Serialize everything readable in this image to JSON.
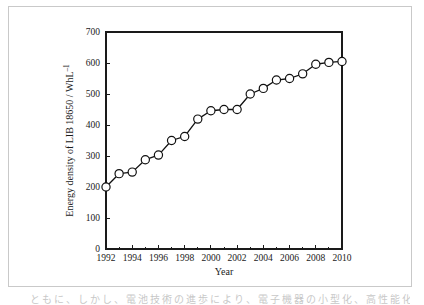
{
  "figure": {
    "border_color": "#c9c9c9",
    "background": "#ffffff",
    "bleed_text": "ともに、しかし、電池技術の進歩により、電子機器の小型化、高性能化"
  },
  "chart_data": {
    "type": "line",
    "title": "",
    "subtitle": "",
    "xlabel": "Year",
    "ylabel": "Energy density of LIB 18650 / WhL⁻¹",
    "ylabel_parts": {
      "prefix": "Energy density of LIB 18650 / WhL",
      "superscript": "–1"
    },
    "xlim": [
      1992,
      2010
    ],
    "ylim": [
      0,
      700
    ],
    "x_ticks": [
      1992,
      1994,
      1996,
      1998,
      2000,
      2002,
      2004,
      2006,
      2008,
      2010
    ],
    "x_tick_labels": [
      "1992",
      "1994",
      "1996",
      "1998",
      "2000",
      "2002",
      "2004",
      "2006",
      "2008",
      "2010"
    ],
    "x_minor_ticks": [
      1993,
      1995,
      1997,
      1999,
      2001,
      2003,
      2005,
      2007,
      2009
    ],
    "y_ticks": [
      0,
      100,
      200,
      300,
      400,
      500,
      600,
      700
    ],
    "y_tick_labels": [
      "0",
      "100",
      "200",
      "300",
      "400",
      "500",
      "600",
      "700"
    ],
    "grid": false,
    "legend": false,
    "legend_position": "none",
    "marker": "open-circle",
    "marker_face_color": "#ffffff",
    "marker_edge_color": "#111111",
    "line_color": "#111111",
    "x": [
      1992,
      1993,
      1994,
      1995,
      1996,
      1997,
      1998,
      1999,
      2000,
      2001,
      2002,
      2003,
      2004,
      2005,
      2006,
      2007,
      2008,
      2009,
      2010
    ],
    "values": [
      200,
      243,
      248,
      288,
      303,
      350,
      363,
      419,
      446,
      450,
      450,
      500,
      518,
      545,
      550,
      565,
      596,
      602,
      605
    ],
    "series": [
      {
        "name": "Energy density of LIB 18650",
        "values": [
          200,
          243,
          248,
          288,
          303,
          350,
          363,
          419,
          446,
          450,
          450,
          500,
          518,
          545,
          550,
          565,
          596,
          602,
          605
        ]
      }
    ]
  }
}
